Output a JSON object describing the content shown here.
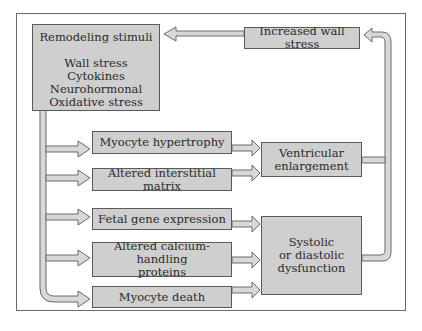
{
  "diagram": {
    "colors": {
      "box_fill": "#cfcfcf",
      "box_border": "#5a5a5a",
      "arrow_fill": "#d8d8d8",
      "arrow_stroke": "#6a6a6a",
      "frame": "#6a6a6a"
    },
    "nodes": {
      "remodeling_stimuli": {
        "heading": "Remodeling stimuli",
        "items": [
          "Wall stress",
          "Cytokines",
          "Neurohormonal",
          "Oxidative stress"
        ]
      },
      "increased_wall_stress": {
        "label": "Increased wall stress"
      },
      "myocyte_hypertrophy": {
        "label": "Myocyte hypertrophy"
      },
      "altered_interstitial_matrix": {
        "label": "Altered interstitial matrix"
      },
      "fetal_gene_expression": {
        "label": "Fetal gene expression"
      },
      "altered_calcium_handling": {
        "line1": "Altered calcium-handling",
        "line2": "proteins"
      },
      "myocyte_death": {
        "label": "Myocyte death"
      },
      "ventricular_enlargement": {
        "line1": "Ventricular",
        "line2": "enlargement"
      },
      "systolic_diastolic_dysfunction": {
        "line1": "Systolic",
        "line2": "or diastolic",
        "line3": "dysfunction"
      }
    },
    "edges": [
      {
        "from": "remodeling_stimuli",
        "to": "myocyte_hypertrophy"
      },
      {
        "from": "remodeling_stimuli",
        "to": "altered_interstitial_matrix"
      },
      {
        "from": "remodeling_stimuli",
        "to": "fetal_gene_expression"
      },
      {
        "from": "remodeling_stimuli",
        "to": "altered_calcium_handling"
      },
      {
        "from": "remodeling_stimuli",
        "to": "myocyte_death"
      },
      {
        "from": "myocyte_hypertrophy",
        "to": "ventricular_enlargement"
      },
      {
        "from": "altered_interstitial_matrix",
        "to": "ventricular_enlargement"
      },
      {
        "from": "fetal_gene_expression",
        "to": "systolic_diastolic_dysfunction"
      },
      {
        "from": "altered_calcium_handling",
        "to": "systolic_diastolic_dysfunction"
      },
      {
        "from": "myocyte_death",
        "to": "systolic_diastolic_dysfunction"
      },
      {
        "from": "ventricular_enlargement",
        "to": "increased_wall_stress"
      },
      {
        "from": "systolic_diastolic_dysfunction",
        "to": "increased_wall_stress"
      },
      {
        "from": "increased_wall_stress",
        "to": "remodeling_stimuli"
      }
    ]
  }
}
